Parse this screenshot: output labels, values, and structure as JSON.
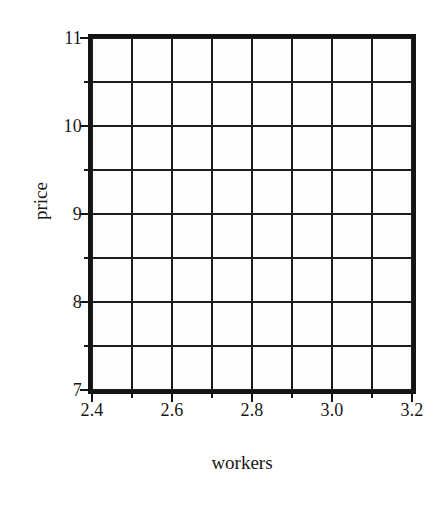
{
  "chart_data": {
    "type": "scatter",
    "title": "",
    "subtitle": "",
    "xlabel": "workers",
    "ylabel": "price",
    "xlim": [
      2.4,
      3.2
    ],
    "ylim": [
      7,
      11
    ],
    "grid": true,
    "legend": null,
    "annotations": [],
    "series": [
      {
        "name": "",
        "x": [],
        "y": [],
        "values": []
      }
    ],
    "x_major_ticks": [
      2.4,
      2.6,
      2.8,
      3.0,
      3.2
    ],
    "x_minor_ticks": [
      2.5,
      2.7,
      2.9,
      3.1
    ],
    "x_gridlines": [
      2.4,
      2.5,
      2.6,
      2.7,
      2.8,
      2.9,
      3.0,
      3.1,
      3.2
    ],
    "y_major_ticks": [
      7,
      8,
      9,
      10,
      11
    ],
    "y_minor_ticks": [
      7.5,
      8.5,
      9.5,
      10.5
    ],
    "y_gridlines": [
      7,
      7.5,
      8,
      8.5,
      9,
      9.5,
      10,
      10.5,
      11
    ],
    "x_tick_labels": [
      "2.4",
      "2.6",
      "2.8",
      "3.0",
      "3.2"
    ],
    "y_tick_labels": [
      "7",
      "8",
      "9",
      "10",
      "11"
    ],
    "colors": {
      "axis": "#141414",
      "grid": "#1d1d1d",
      "text": "#171717",
      "plot_background": "#fdfdfb",
      "figure_background": "#ffffff"
    }
  },
  "axes": {
    "x_title": "workers",
    "y_title": "price"
  }
}
